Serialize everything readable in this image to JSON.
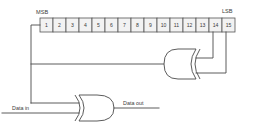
{
  "figure": {
    "type": "logic-circuit-diagram"
  },
  "register": {
    "msb_label": "MSB",
    "lsb_label": "LSB",
    "cells": [
      {
        "index": 1,
        "label": "1"
      },
      {
        "index": 2,
        "label": "2"
      },
      {
        "index": 3,
        "label": "3"
      },
      {
        "index": 4,
        "label": "4"
      },
      {
        "index": 5,
        "label": "5"
      },
      {
        "index": 6,
        "label": "6"
      },
      {
        "index": 7,
        "label": "7"
      },
      {
        "index": 8,
        "label": "8"
      },
      {
        "index": 9,
        "label": "9"
      },
      {
        "index": 10,
        "label": "10"
      },
      {
        "index": 11,
        "label": "11"
      },
      {
        "index": 12,
        "label": "12"
      },
      {
        "index": 13,
        "label": "13"
      },
      {
        "index": 14,
        "label": "14"
      },
      {
        "index": 15,
        "label": "15"
      }
    ]
  },
  "signals": {
    "data_in": "Data in",
    "data_out": "Data out"
  },
  "gates": [
    {
      "id": "upper-xor",
      "type": "xor",
      "orientation": "mirrored"
    },
    {
      "id": "lower-xor",
      "type": "xor",
      "orientation": "normal"
    }
  ],
  "colors": {
    "wire": "#4a4a4a",
    "cell_fill": "#f2f2f2",
    "cell_stroke": "#555555",
    "text": "#3a3a3a",
    "background": "#ffffff"
  }
}
